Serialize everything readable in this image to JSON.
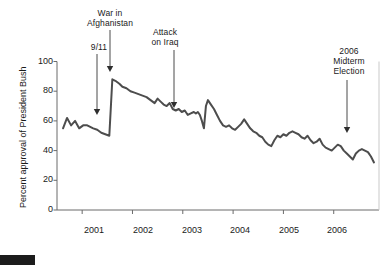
{
  "chart_data": {
    "type": "line",
    "title": "",
    "xlabel": "",
    "ylabel": "Percent approval of President Bush",
    "ylim": [
      0,
      100
    ],
    "yticks": [
      0,
      20,
      40,
      60,
      80,
      100
    ],
    "xlim": [
      2000.5,
      2006.9
    ],
    "xticks": [
      2001,
      2002,
      2003,
      2004,
      2005,
      2006
    ],
    "xtick_labels": [
      "2001",
      "2002",
      "2003",
      "2004",
      "2005",
      "2006"
    ],
    "grid": false,
    "legend": null,
    "line_color": "#4d4d4d",
    "series": [
      {
        "name": "Percent approval of President Bush",
        "x": [
          2000.62,
          2000.7,
          2000.78,
          2000.86,
          2000.94,
          2001.02,
          2001.1,
          2001.16,
          2001.22,
          2001.3,
          2001.38,
          2001.46,
          2001.54,
          2001.6,
          2001.66,
          2001.7,
          2001.74,
          2001.8,
          2001.88,
          2001.96,
          2002.04,
          2002.12,
          2002.2,
          2002.28,
          2002.36,
          2002.44,
          2002.5,
          2002.56,
          2002.62,
          2002.68,
          2002.74,
          2002.8,
          2002.86,
          2002.92,
          2002.98,
          2003.04,
          2003.1,
          2003.16,
          2003.22,
          2003.26,
          2003.3,
          2003.34,
          2003.38,
          2003.42,
          2003.46,
          2003.5,
          2003.56,
          2003.62,
          2003.68,
          2003.74,
          2003.8,
          2003.86,
          2003.92,
          2003.98,
          2004.04,
          2004.1,
          2004.16,
          2004.22,
          2004.28,
          2004.34,
          2004.4,
          2004.46,
          2004.52,
          2004.58,
          2004.64,
          2004.7,
          2004.76,
          2004.82,
          2004.88,
          2004.94,
          2005.0,
          2005.06,
          2005.12,
          2005.18,
          2005.24,
          2005.3,
          2005.36,
          2005.42,
          2005.48,
          2005.54,
          2005.6,
          2005.66,
          2005.72,
          2005.78,
          2005.84,
          2005.9,
          2005.96,
          2006.02,
          2006.08,
          2006.14,
          2006.2,
          2006.26,
          2006.32,
          2006.38,
          2006.44,
          2006.5,
          2006.56,
          2006.62,
          2006.68,
          2006.74,
          2006.8
        ],
        "y": [
          55,
          62,
          57,
          60,
          55,
          57,
          57,
          56,
          55,
          54,
          52,
          51,
          50,
          88,
          87,
          86,
          85,
          83,
          82,
          80,
          79,
          78,
          77,
          76,
          74,
          72,
          75,
          73,
          71,
          70,
          72,
          68,
          67,
          68,
          66,
          67,
          64,
          65,
          66,
          65,
          66,
          64,
          60,
          55,
          70,
          74,
          71,
          68,
          64,
          60,
          57,
          56,
          57,
          55,
          54,
          56,
          58,
          61,
          58,
          55,
          53,
          52,
          50,
          49,
          46,
          44,
          43,
          47,
          50,
          49,
          51,
          50,
          52,
          53,
          52,
          51,
          49,
          48,
          50,
          47,
          45,
          46,
          48,
          44,
          42,
          41,
          40,
          42,
          44,
          43,
          40,
          38,
          36,
          34,
          38,
          40,
          41,
          40,
          39,
          36,
          32
        ]
      }
    ],
    "annotations": [
      {
        "name": "9/11",
        "label": "9/11",
        "text_x": 86,
        "text_y": 42,
        "text_w": 26,
        "arrow_x": 97,
        "arrow_y0": 54,
        "arrow_y1": 115
      },
      {
        "name": "war-in-afghanistan",
        "label": "War in\nAfghanistan",
        "text_x": 74,
        "text_y": 8,
        "text_w": 72,
        "arrow_x": 110,
        "arrow_y0": 30,
        "arrow_y1": 72
      },
      {
        "name": "attack-on-iraq",
        "label": "Attack\non Iraq",
        "text_x": 137,
        "text_y": 27,
        "text_w": 56,
        "arrow_x": 174,
        "arrow_y0": 50,
        "arrow_y1": 108
      },
      {
        "name": "2006-midterm-election",
        "label": "2006\nMidterm\nElection",
        "text_x": 320,
        "text_y": 46,
        "text_w": 58,
        "arrow_x": 347,
        "arrow_y0": 80,
        "arrow_y1": 133
      }
    ]
  },
  "figure": {
    "ylabel": "Percent approval of President Bush",
    "ytick_labels": [
      "100",
      "80",
      "60",
      "40",
      "20",
      "0"
    ],
    "xtick_labels": [
      "2001",
      "2002",
      "2003",
      "2004",
      "2005",
      "2006"
    ],
    "anno_911": "9/11",
    "anno_afghanistan": "War in\nAfghanistan",
    "anno_iraq": "Attack\non Iraq",
    "anno_midterm": "2006\nMidterm\nElection"
  }
}
